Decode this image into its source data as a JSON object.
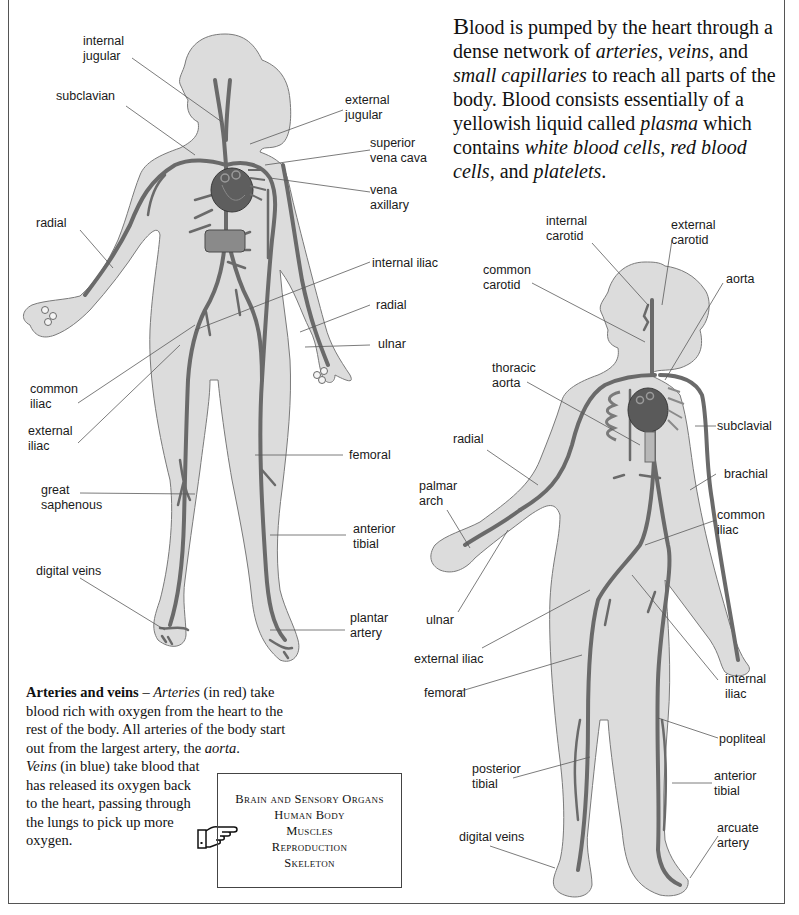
{
  "intro": {
    "segments": [
      {
        "text": "B",
        "style": "big"
      },
      {
        "text": "lood is pumped by the heart through a dense network of ",
        "style": "normal"
      },
      {
        "text": "arteries, veins,",
        "style": "italic"
      },
      {
        "text": " and ",
        "style": "normal"
      },
      {
        "text": "small capillaries",
        "style": "italic"
      },
      {
        "text": " to reach all parts of the body. Blood consists essentially of a yellowish liquid called ",
        "style": "normal"
      },
      {
        "text": "plasma",
        "style": "italic"
      },
      {
        "text": " which contains ",
        "style": "normal"
      },
      {
        "text": "white blood cells, red blood cells,",
        "style": "italic"
      },
      {
        "text": " and ",
        "style": "normal"
      },
      {
        "text": "platelets",
        "style": "italic"
      },
      {
        "text": ".",
        "style": "normal"
      }
    ]
  },
  "veins_figure": {
    "title": "Veins",
    "labels": [
      {
        "id": "internal-jugular",
        "text": "internal\njugular"
      },
      {
        "id": "subclavian",
        "text": "subclavian"
      },
      {
        "id": "external-jugular",
        "text": "external\njugular"
      },
      {
        "id": "superior-vena-cava",
        "text": "superior\nvena cava"
      },
      {
        "id": "vena-axillary",
        "text": "vena\naxillary"
      },
      {
        "id": "radial",
        "text": "radial"
      },
      {
        "id": "internal-iliac",
        "text": "internal iliac"
      },
      {
        "id": "radial-right",
        "text": "radial"
      },
      {
        "id": "ulnar",
        "text": "ulnar"
      },
      {
        "id": "common-iliac",
        "text": "common\niliac"
      },
      {
        "id": "external-iliac",
        "text": "external\niliac"
      },
      {
        "id": "femoral",
        "text": "femoral"
      },
      {
        "id": "great-saphenous",
        "text": "great\nsaphenous"
      },
      {
        "id": "anterior-tibial",
        "text": "anterior\ntibial"
      },
      {
        "id": "digital-veins",
        "text": "digital veins"
      },
      {
        "id": "plantar-artery",
        "text": "plantar\nartery"
      }
    ]
  },
  "arteries_figure": {
    "title": "Arteries",
    "labels": [
      {
        "id": "internal-carotid",
        "text": "internal\ncarotid"
      },
      {
        "id": "external-carotid",
        "text": "external\ncarotid"
      },
      {
        "id": "common-carotid",
        "text": "common\ncarotid"
      },
      {
        "id": "aorta",
        "text": "aorta"
      },
      {
        "id": "thoracic-aorta",
        "text": "thoracic\naorta"
      },
      {
        "id": "subclavial",
        "text": "subclavial"
      },
      {
        "id": "radial",
        "text": "radial"
      },
      {
        "id": "brachial",
        "text": "brachial"
      },
      {
        "id": "palmar-arch",
        "text": "palmar\narch"
      },
      {
        "id": "common-iliac",
        "text": "common\niliac"
      },
      {
        "id": "ulnar",
        "text": "ulnar"
      },
      {
        "id": "external-iliac",
        "text": "external iliac"
      },
      {
        "id": "internal-iliac",
        "text": "internal\niliac"
      },
      {
        "id": "femoral",
        "text": "femoral"
      },
      {
        "id": "popliteal",
        "text": "popliteal"
      },
      {
        "id": "posterior-tibial",
        "text": "posterior\ntibial"
      },
      {
        "id": "anterior-tibial",
        "text": "anterior\ntibial"
      },
      {
        "id": "digital-veins",
        "text": "digital veins"
      },
      {
        "id": "arcuate-artery",
        "text": "arcuate\nartery"
      }
    ]
  },
  "caption": {
    "heading": "Arteries and veins",
    "dash": " – ",
    "p1_italic": "Arteries",
    "p1_rest": " (in red) take blood rich with oxygen from the heart to the rest of the body. All arteries of the body start out from the largest artery, the ",
    "p1_aorta": "aorta",
    "p1_end": ".",
    "p2_italic": "Veins",
    "p2_rest": " (in blue) take blood that has released its oxygen back to the heart, passing through the lungs to pick up more oxygen."
  },
  "see_also": {
    "icon": "pointing-hand-icon",
    "items": [
      "Brain and Sensory Organs",
      "Human Body",
      "Muscles",
      "Reproduction",
      "Skeleton"
    ]
  },
  "colors": {
    "silhouette": "#dcdcdc",
    "silhouette_outline": "#7a7a7a",
    "vessel": "#6a6a6a",
    "heart": "#585858",
    "leader_line": "#5a5a5a",
    "text": "#111111"
  }
}
